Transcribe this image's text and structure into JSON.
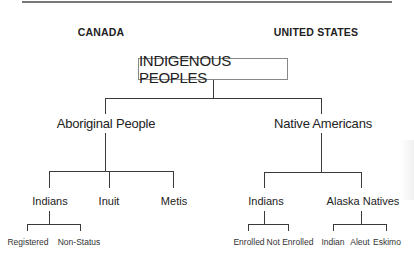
{
  "header": {
    "left_country": "CANADA",
    "right_country": "UNITED STATES"
  },
  "root": {
    "label": "INDIGENOUS PEOPLES"
  },
  "canada": {
    "label": "Aboriginal People",
    "children": [
      {
        "label": "Indians",
        "children": [
          {
            "label": "Registered"
          },
          {
            "label": "Non-Status"
          }
        ]
      },
      {
        "label": "Inuit"
      },
      {
        "label": "Metis"
      }
    ]
  },
  "united_states": {
    "label": "Native Americans",
    "children": [
      {
        "label": "Indians",
        "children": [
          {
            "label": "Enrolled"
          },
          {
            "label": "Not Enrolled"
          }
        ]
      },
      {
        "label": "Alaska Natives",
        "children": [
          {
            "label": "Indian"
          },
          {
            "label": "Aleut"
          },
          {
            "label": "Eskimo"
          }
        ]
      }
    ]
  },
  "colors": {
    "line": "#3a3a3a",
    "text": "#222222",
    "box_border": "#888888"
  }
}
